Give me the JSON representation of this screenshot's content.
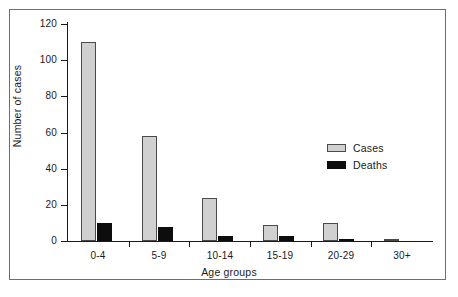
{
  "chart_data": {
    "type": "bar",
    "title": "",
    "xlabel": "Age groups",
    "ylabel": "Number of cases",
    "categories": [
      "0-4",
      "5-9",
      "10-14",
      "15-19",
      "20-29",
      "30+"
    ],
    "series": [
      {
        "name": "Cases",
        "color": "#d0d0d0",
        "values": [
          110,
          58,
          24,
          9,
          10,
          1
        ]
      },
      {
        "name": "Deaths",
        "color": "#0d0d0d",
        "values": [
          10,
          8,
          3,
          3,
          1,
          0
        ]
      }
    ],
    "ylim": [
      0,
      120
    ],
    "yticks": [
      0,
      20,
      40,
      60,
      80,
      100,
      120
    ],
    "ytick_labels": [
      "0",
      "20",
      "40",
      "60",
      "80",
      "100",
      "120"
    ],
    "grid": false,
    "legend_position": "center-right",
    "legend_entries": [
      "Cases",
      "Deaths"
    ],
    "annotations": []
  },
  "axes": {
    "y_title": "Number of cases",
    "x_title": "Age groups"
  },
  "legend": {
    "items": [
      {
        "label": "Cases"
      },
      {
        "label": "Deaths"
      }
    ]
  }
}
